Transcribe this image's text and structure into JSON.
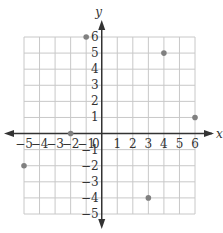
{
  "chart_data": {
    "type": "scatter",
    "title": "",
    "xlabel": "x",
    "ylabel": "y",
    "xlim": [
      -5,
      6
    ],
    "ylim": [
      -5,
      6
    ],
    "grid": true,
    "x_ticks": [
      -5,
      -4,
      -3,
      -2,
      -1,
      0,
      1,
      2,
      3,
      4,
      5,
      6
    ],
    "y_ticks": [
      -5,
      -4,
      -3,
      -2,
      -1,
      1,
      2,
      3,
      4,
      5,
      6
    ],
    "x_tick_labels": [
      "−5",
      "−4",
      "−3",
      "−2",
      "−1",
      "0",
      "1",
      "2",
      "3",
      "4",
      "5",
      "6"
    ],
    "y_tick_labels": [
      "−5",
      "−4",
      "−3",
      "−2",
      "−1",
      "1",
      "2",
      "3",
      "4",
      "5",
      "6"
    ],
    "points": [
      {
        "x": -1,
        "y": 6
      },
      {
        "x": 4,
        "y": 5
      },
      {
        "x": 6,
        "y": 1
      },
      {
        "x": -2,
        "y": 0
      },
      {
        "x": -5,
        "y": -2
      },
      {
        "x": 3,
        "y": -4
      }
    ],
    "colors": {
      "grid": "#c8c8c8",
      "axis": "#333333",
      "point": "#808080"
    }
  }
}
